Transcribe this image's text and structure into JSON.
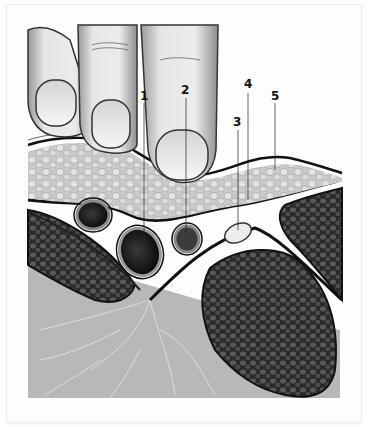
{
  "figure": {
    "type": "anatomical-illustration",
    "labels": [
      {
        "id": "1",
        "text": "1",
        "x": 140,
        "y": 90
      },
      {
        "id": "2",
        "text": "2",
        "x": 181,
        "y": 84
      },
      {
        "id": "3",
        "text": "3",
        "x": 233,
        "y": 116
      },
      {
        "id": "4",
        "text": "4",
        "x": 244,
        "y": 78
      },
      {
        "id": "5",
        "text": "5",
        "x": 271,
        "y": 90
      }
    ],
    "colors": {
      "background": "#ffffff",
      "skin": "#dcdcdc",
      "fat": "#c8c8c8",
      "muscle": "#3e3e3e",
      "vessel_dark": "#141414",
      "fascia": "#1a1a1a",
      "deep_tissue": "#b4b4b4"
    }
  }
}
